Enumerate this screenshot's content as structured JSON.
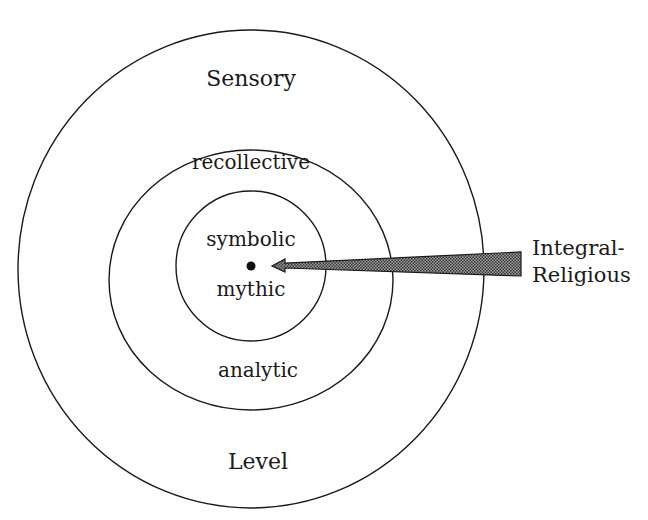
{
  "diagram": {
    "type": "concentric-circles",
    "rings": [
      {
        "name": "outer",
        "top_label": "Sensory",
        "bottom_label": "Level"
      },
      {
        "name": "middle",
        "top_label": "recollective",
        "bottom_label": "analytic"
      },
      {
        "name": "inner",
        "top_label": "symbolic",
        "bottom_label": "mythic"
      }
    ],
    "arrow": {
      "label_line1": "Integral-",
      "label_line2": "Religious",
      "points_to": "center"
    },
    "colors": {
      "stroke": "#1a1a1a",
      "arrow_fill": "#6e6e6e",
      "background": "#ffffff"
    }
  }
}
